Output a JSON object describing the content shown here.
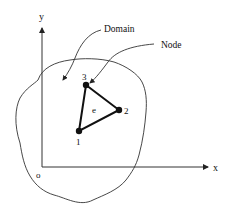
{
  "diagram": {
    "type": "finite-element-domain",
    "axes": {
      "x_label": "x",
      "y_label": "y",
      "origin_label": "o"
    },
    "callouts": {
      "domain": "Domain",
      "node": "Node"
    },
    "element": {
      "label": "e",
      "nodes": [
        {
          "id": "1",
          "label": "1"
        },
        {
          "id": "2",
          "label": "2"
        },
        {
          "id": "3",
          "label": "3"
        }
      ]
    },
    "colors": {
      "stroke": "#111111",
      "background": "#ffffff"
    }
  }
}
